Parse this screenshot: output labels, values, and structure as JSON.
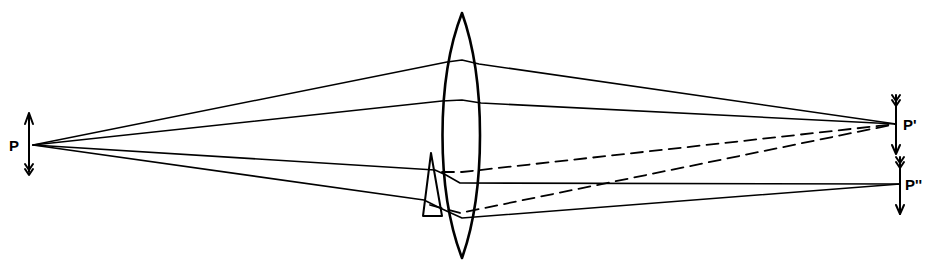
{
  "diagram": {
    "type": "ray-optics",
    "labels": {
      "object": "P",
      "image_primary": "P'",
      "image_secondary": "P''"
    },
    "colors": {
      "stroke": "#000000",
      "background": "#ffffff"
    },
    "object_point": {
      "x": 33,
      "y": 145
    },
    "image_primary_point": {
      "x": 896,
      "y": 124
    },
    "image_secondary_point": {
      "x": 900,
      "y": 184
    },
    "lens": {
      "center_x": 462,
      "top_y": 13,
      "bottom_y": 258,
      "half_width": 21
    },
    "prism": {
      "apex": [
        431,
        153
      ],
      "base_left": [
        423,
        216
      ],
      "base_right": [
        442,
        216
      ]
    },
    "rays_solid": [
      [
        [
          33,
          145
        ],
        [
          447,
          62
        ],
        [
          479,
          64
        ],
        [
          896,
          124
        ]
      ],
      [
        [
          33,
          145
        ],
        [
          442,
          101
        ],
        [
          481,
          103
        ],
        [
          896,
          124
        ]
      ],
      [
        [
          33,
          145
        ],
        [
          435,
          170
        ],
        [
          460,
          183
        ],
        [
          900,
          184
        ]
      ],
      [
        [
          33,
          145
        ],
        [
          428,
          200
        ],
        [
          462,
          218
        ],
        [
          900,
          184
        ]
      ]
    ],
    "rays_dashed": [
      [
        [
          443,
          172
        ],
        [
          896,
          124
        ]
      ],
      [
        [
          440,
          208
        ],
        [
          460,
          213
        ],
        [
          896,
          124
        ]
      ]
    ]
  }
}
